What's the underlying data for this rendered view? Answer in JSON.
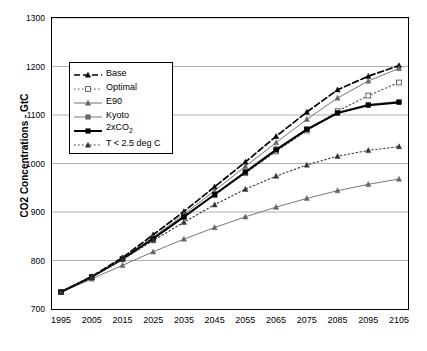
{
  "chart_data": {
    "type": "line",
    "title": "",
    "xlabel": "",
    "ylabel": "CO2 Concentrations - GtC",
    "xlim": [
      1995,
      2105
    ],
    "ylim": [
      700,
      1300
    ],
    "yticks": [
      700,
      800,
      900,
      1000,
      1100,
      1200,
      1300
    ],
    "xticks": [
      1995,
      2005,
      2015,
      2025,
      2035,
      2045,
      2055,
      2065,
      2075,
      2085,
      2095,
      2105
    ],
    "grid": "horizontal",
    "legend_position": "upper-left-inside",
    "x": [
      1995,
      2005,
      2015,
      2025,
      2035,
      2045,
      2055,
      2065,
      2075,
      2085,
      2095,
      2105
    ],
    "series": [
      {
        "name": "Base",
        "style": "dashed",
        "marker": "triangle",
        "color": "#000000",
        "values": [
          735,
          767,
          806,
          853,
          901,
          952,
          1003,
          1056,
          1106,
          1152,
          1180,
          1202
        ]
      },
      {
        "name": "Optimal",
        "style": "dotted",
        "marker": "open-square",
        "color": "#555555",
        "values": [
          735,
          766,
          803,
          846,
          890,
          935,
          980,
          1025,
          1068,
          1108,
          1140,
          1167
        ]
      },
      {
        "name": "E90",
        "style": "solid-thin",
        "marker": "triangle",
        "color": "#666666",
        "values": [
          735,
          766,
          804,
          848,
          895,
          944,
          994,
          1043,
          1091,
          1135,
          1170,
          1196
        ]
      },
      {
        "name": "Kyoto",
        "style": "solid-thin",
        "marker": "square",
        "color": "#666666",
        "values": [
          735,
          766,
          803,
          845,
          890,
          937,
          984,
          1030,
          1072,
          1105,
          1122,
          1128
        ]
      },
      {
        "name": "2xCO2",
        "style": "solid-thick",
        "marker": "square",
        "color": "#000000",
        "values": [
          735,
          766,
          803,
          845,
          890,
          936,
          982,
          1028,
          1070,
          1104,
          1120,
          1126
        ]
      },
      {
        "name": "T < 2.5 deg C",
        "style": "dotted",
        "marker": "triangle",
        "color": "#333333",
        "values": [
          735,
          766,
          802,
          841,
          879,
          915,
          947,
          974,
          997,
          1015,
          1027,
          1035
        ]
      }
    ],
    "extra_series": [
      {
        "name": "lower-bound-curve",
        "style": "solid-thin",
        "marker": "triangle",
        "color": "#666666",
        "values": [
          735,
          762,
          790,
          818,
          844,
          868,
          890,
          910,
          928,
          944,
          957,
          968
        ]
      }
    ]
  },
  "legend": {
    "items": [
      {
        "label": "Base",
        "label_sub": "",
        "label_tail": ""
      },
      {
        "label": "Optimal",
        "label_sub": "",
        "label_tail": ""
      },
      {
        "label": "E90",
        "label_sub": "",
        "label_tail": ""
      },
      {
        "label": "Kyoto",
        "label_sub": "",
        "label_tail": ""
      },
      {
        "label": "2xCO",
        "label_sub": "2",
        "label_tail": ""
      },
      {
        "label": "T < 2.5 deg C",
        "label_sub": "",
        "label_tail": ""
      }
    ]
  },
  "axes": {
    "y_title": "CO2 Concentrations - GtC",
    "y_ticks": [
      "1300",
      "1200",
      "1100",
      "1000",
      "900",
      "800",
      "700"
    ],
    "x_ticks": [
      "1995",
      "2005",
      "2015",
      "2025",
      "2035",
      "2045",
      "2055",
      "2065",
      "2075",
      "2085",
      "2095",
      "2105"
    ]
  }
}
